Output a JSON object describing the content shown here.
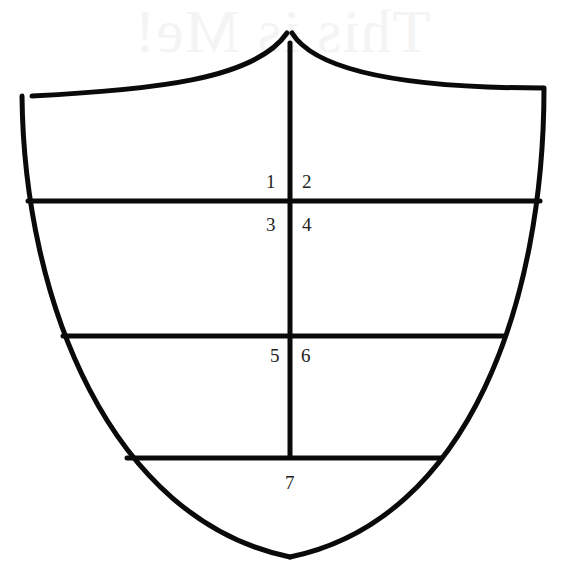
{
  "ghost_title": "This is Me!",
  "shield": {
    "stroke_color": "#0a0a0a",
    "background": "#ffffff",
    "sections": [
      {
        "id": 1,
        "label": "1"
      },
      {
        "id": 2,
        "label": "2"
      },
      {
        "id": 3,
        "label": "3"
      },
      {
        "id": 4,
        "label": "4"
      },
      {
        "id": 5,
        "label": "5"
      },
      {
        "id": 6,
        "label": "6"
      },
      {
        "id": 7,
        "label": "7"
      }
    ]
  }
}
